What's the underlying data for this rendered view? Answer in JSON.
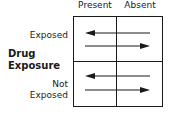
{
  "diagram": {
    "column_headers": [
      "Present",
      "Absent"
    ],
    "row_axis_label": [
      "Drug",
      "Exposure"
    ],
    "row_headers": [
      {
        "lines": [
          "Exposed"
        ]
      },
      {
        "lines": [
          "Not",
          "Exposed"
        ]
      }
    ],
    "cells": [
      {
        "row": "Exposed",
        "arrows": [
          "left",
          "right"
        ]
      },
      {
        "row": "Not Exposed",
        "arrows": [
          "left",
          "right"
        ]
      }
    ],
    "colors": {
      "line": "#1a1a1a",
      "background": "#ffffff"
    }
  }
}
